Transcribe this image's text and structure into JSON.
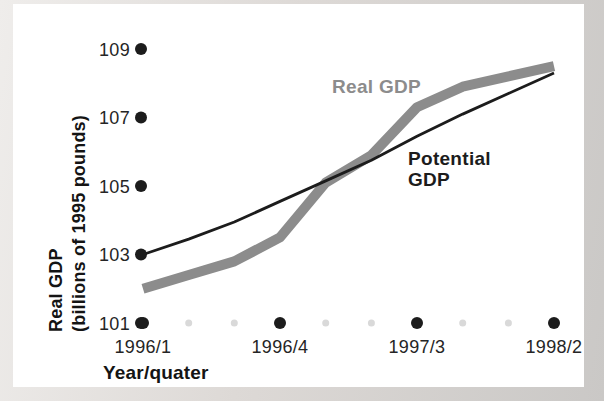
{
  "colors": {
    "page_background": "#d8d5d2",
    "panel_background": "#ffffff",
    "real_gdp_line": "#8c8c8c",
    "potential_gdp_line": "#1c1c1c",
    "major_tick_dot": "#1c1c1c",
    "minor_tick_dot": "#d9d9d9",
    "tick_text": "#252525"
  },
  "chart_data": {
    "type": "line",
    "title": "",
    "xlabel": "Year/quater",
    "ylabel": "Real GDP (billions of 1995 pounds)",
    "ylabel_lines": [
      "Real GDP",
      "(billions of 1995 pounds)"
    ],
    "x": [
      "1996/1",
      "1996/2",
      "1996/3",
      "1996/4",
      "1997/1",
      "1997/2",
      "1997/3",
      "1997/4",
      "1998/1",
      "1998/2"
    ],
    "x_tick_labels": [
      "1996/1",
      "1996/4",
      "1997/3",
      "1998/2"
    ],
    "x_labeled_indices": [
      0,
      3,
      6,
      9
    ],
    "y_ticks": [
      101,
      103,
      105,
      107,
      109
    ],
    "ylim": [
      101,
      109.5
    ],
    "grid": false,
    "legend_position": "inline-annotations",
    "series": [
      {
        "name": "Real GDP",
        "color": "#8c8c8c",
        "stroke_width": 10,
        "values": [
          102.0,
          102.4,
          102.8,
          103.5,
          105.1,
          105.9,
          107.3,
          107.9,
          108.2,
          108.5
        ]
      },
      {
        "name": "Potential GDP",
        "color": "#1c1c1c",
        "stroke_width": 2.8,
        "values": [
          103.0,
          103.45,
          103.95,
          104.55,
          105.15,
          105.75,
          106.45,
          107.1,
          107.7,
          108.3
        ]
      }
    ],
    "annotations": [
      {
        "lines": [
          "Real GDP"
        ],
        "series": "Real GDP",
        "color": "#8c8c8c"
      },
      {
        "lines": [
          "Potential",
          "GDP"
        ],
        "series": "Potential GDP",
        "color": "#1c1c1c"
      }
    ]
  }
}
